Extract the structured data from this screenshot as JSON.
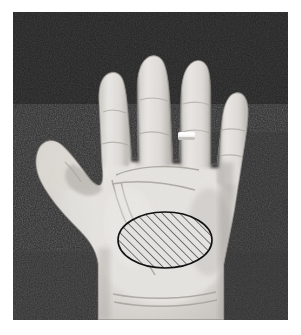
{
  "figure": {
    "kind": "photograph",
    "caption": "",
    "color_mode": "grayscale",
    "canvas": {
      "width": 301,
      "height": 335
    },
    "page_background": "#ffffff"
  },
  "photo": {
    "x": 13,
    "y": 12,
    "width": 275,
    "height": 308,
    "background_color": "#2b2b2b",
    "background_color_dark": "#1c1c1c",
    "background_description": "dark textured cloth backdrop",
    "border_color": "#ffffff"
  },
  "hand": {
    "label": "left hand, palm up",
    "skin_light": "#e9e7e4",
    "skin_mid": "#d5d2cd",
    "skin_shadow": "#b3b0ab",
    "skin_deep_shadow": "#8f8c87",
    "fingers": [
      {
        "name": "index-finger",
        "tip_x": 112,
        "tip_y": 38
      },
      {
        "name": "middle-finger",
        "tip_x": 152,
        "tip_y": 30
      },
      {
        "name": "ring-finger",
        "tip_x": 186,
        "tip_y": 38
      },
      {
        "name": "little-finger",
        "tip_x": 214,
        "tip_y": 68
      },
      {
        "name": "thumb",
        "tip_x": 42,
        "tip_y": 143
      }
    ],
    "ring": {
      "label": "ring",
      "finger": "ring-finger",
      "x": 178,
      "y": 132,
      "width": 17,
      "height": 8,
      "color": "#f2f1ee"
    }
  },
  "annotation": {
    "label": "hatched ellipse region marked on palm",
    "shape": "ellipse",
    "center_x": 165,
    "center_y": 240,
    "radius_x": 47,
    "radius_y": 28,
    "outline_color": "#111111",
    "outline_width": 1.6,
    "fill_pattern": "diagonal-hatch",
    "hatch_color": "#1a1a1a",
    "hatch_angle_degrees": 45,
    "hatch_spacing_px": 4.4,
    "hatch_line_width": 1.1,
    "fill_base_color": "#e4e2df"
  }
}
